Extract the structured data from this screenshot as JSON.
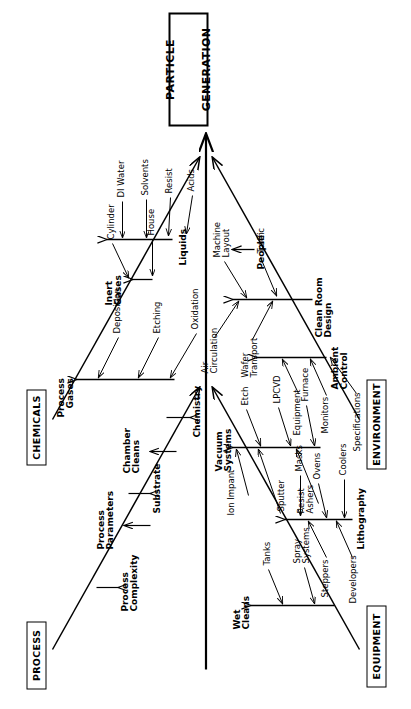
{
  "diagram": {
    "kind": "fishbone-ishikawa",
    "orientation": "rotated-90-ccw",
    "effect": {
      "line1": "PARTICLE",
      "line2": "GENERATION",
      "text": "PARTICLE GENERATION"
    },
    "ink_color": "#000000",
    "paper_color": "#ffffff",
    "categories": [
      {
        "id": "chemicals",
        "label": "CHEMICALS",
        "side": "top",
        "branches": [
          {
            "label": "Process\nGases",
            "bold": true,
            "twigs": [
              "Deposition",
              "Etching",
              "Oxidation"
            ]
          },
          {
            "label": "Inert\nGases",
            "bold": true,
            "twigs": [
              "Cylinder",
              "House"
            ]
          },
          {
            "label": "Liquids",
            "bold": true,
            "twigs": [
              "DI Water",
              "Solvents",
              "Resist",
              "Acids"
            ]
          }
        ]
      },
      {
        "id": "environment",
        "label": "ENVIRONMENT",
        "side": "bottom",
        "branches": [
          {
            "label": "People",
            "bold": true,
            "twigs": [
              "Wafer\nTransport",
              "Traffic"
            ]
          },
          {
            "label": "Clean Room\nDesign",
            "bold": true,
            "twigs": [
              "Air\nCirculation",
              "Machine\nLayout"
            ]
          },
          {
            "label": "Ambient\nControl",
            "bold": true,
            "twigs": [
              "Equipment",
              "Monitors",
              "Specifications"
            ]
          }
        ]
      },
      {
        "id": "process",
        "label": "PROCESS",
        "side": "top",
        "branches": [
          {
            "label": "Process\nComplexity",
            "bold": true,
            "twigs": []
          },
          {
            "label": "Process\nParameters",
            "bold": true,
            "twigs": []
          },
          {
            "label": "Substrate",
            "bold": true,
            "twigs": []
          },
          {
            "label": "Chamber\nCleans",
            "bold": true,
            "twigs": []
          },
          {
            "label": "Chemistry",
            "bold": true,
            "twigs": []
          }
        ]
      },
      {
        "id": "equipment",
        "label": "EQUIPMENT",
        "side": "bottom",
        "branches": [
          {
            "label": "Vacuum\nSystems",
            "bold": true,
            "twigs": [
              "Sputter",
              "Ion Impant",
              "Resist\nAshers",
              "Etch",
              "LPCVD",
              "Furnace"
            ]
          },
          {
            "label": "Lithography",
            "bold": true,
            "twigs": [
              "Steppers",
              "Developers",
              "Ovens",
              "Coolers",
              "Masks"
            ]
          },
          {
            "label": "Wet\nCleans",
            "bold": true,
            "twigs": [
              "Tanks",
              "Spray\nSystems"
            ]
          }
        ]
      }
    ]
  },
  "text": {
    "effect_l1": "PARTICLE",
    "effect_l2": "GENERATION",
    "cat_chemicals": "CHEMICALS",
    "cat_environment": "ENVIRONMENT",
    "cat_process": "PROCESS",
    "cat_equipment": "EQUIPMENT",
    "chem_process_gases": "Process\nGases",
    "chem_deposition": "Deposition",
    "chem_etching": "Etching",
    "chem_oxidation": "Oxidation",
    "chem_inert_gases": "Inert\nGases",
    "chem_cylinder": "Cylinder",
    "chem_house": "House",
    "chem_liquids": "Liquids",
    "chem_di_water": "DI Water",
    "chem_solvents": "Solvents",
    "chem_resist": "Resist",
    "chem_acids": "Acids",
    "env_people": "People",
    "env_wafer_transport": "Wafer\nTransport",
    "env_traffic": "Traffic",
    "env_clean_room_design": "Clean Room\nDesign",
    "env_air_circulation": "Air\nCirculation",
    "env_machine_layout": "Machine\nLayout",
    "env_ambient_control": "Ambient\nControl",
    "env_equipment": "Equipment",
    "env_monitors": "Monitors",
    "env_specifications": "Specifications",
    "proc_complexity": "Process\nComplexity",
    "proc_parameters": "Process\nParameters",
    "proc_substrate": "Substrate",
    "proc_chamber_cleans": "Chamber\nCleans",
    "proc_chemistry": "Chemistry",
    "eq_vacuum_systems": "Vacuum\nSystems",
    "eq_sputter": "Sputter",
    "eq_ion_impant": "Ion Impant",
    "eq_resist_ashers": "Resist\nAshers",
    "eq_etch": "Etch",
    "eq_lpcvd": "LPCVD",
    "eq_furnace": "Furnace",
    "eq_lithography": "Lithography",
    "eq_steppers": "Steppers",
    "eq_developers": "Developers",
    "eq_ovens": "Ovens",
    "eq_coolers": "Coolers",
    "eq_masks": "Masks",
    "eq_wet_cleans": "Wet\nCleans",
    "eq_tanks": "Tanks",
    "eq_spray_systems": "Spray\nSystems"
  }
}
